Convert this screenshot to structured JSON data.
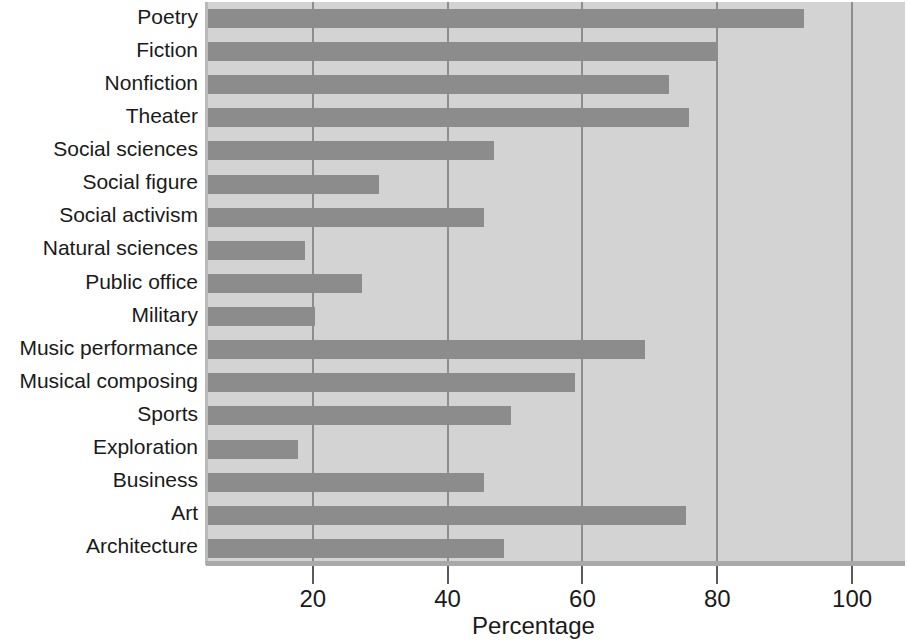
{
  "chart_data": {
    "type": "bar",
    "orientation": "horizontal",
    "title": "",
    "xlabel": "Percentage",
    "ylabel": "",
    "xlim": [
      4.3,
      108
    ],
    "xticks": [
      20,
      40,
      60,
      80,
      100
    ],
    "grid": "vertical",
    "legend": null,
    "categories": [
      "Poetry",
      "Fiction",
      "Nonfiction",
      "Theater",
      "Social sciences",
      "Social figure",
      "Social activism",
      "Natural sciences",
      "Public office",
      "Military",
      "Music performance",
      "Musical composing",
      "Sports",
      "Exploration",
      "Business",
      "Art",
      "Architecture"
    ],
    "values": [
      93,
      80,
      73,
      76,
      47,
      30,
      45.5,
      19,
      27.5,
      20.5,
      69.5,
      59,
      49.5,
      18,
      45.5,
      75.5,
      48.5
    ],
    "bar_color": "#8c8c8c",
    "plot_background": "#d3d3d3",
    "gridline_color": "#8d8d8d"
  },
  "axis": {
    "x_title": "Percentage",
    "tick_labels": [
      "20",
      "40",
      "60",
      "80",
      "100"
    ]
  }
}
